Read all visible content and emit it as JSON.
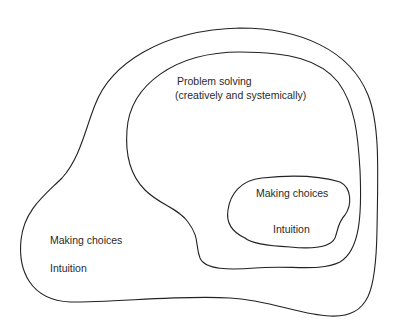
{
  "diagram": {
    "outer_region": {
      "labels": [
        "Making choices",
        "Intuition"
      ]
    },
    "middle_region": {
      "labels": [
        "Problem solving",
        "(creatively and systemically)"
      ]
    },
    "inner_region": {
      "labels": [
        "Making choices",
        "Intuition"
      ]
    },
    "stroke_color": "#222222",
    "background": "#ffffff"
  }
}
